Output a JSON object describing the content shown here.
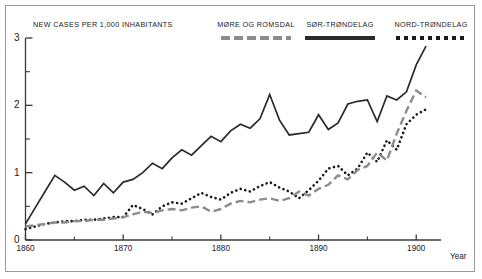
{
  "figure": {
    "y_axis_title": "NEW CASES PER 1,000 INHABITANTS",
    "x_axis_title": "Year"
  },
  "legend": {
    "items": [
      {
        "label": "MØRE OG ROMSDAL",
        "style": "dashed",
        "color": "#8c8c8c",
        "name": "more-og-romsdal"
      },
      {
        "label": "SØR-TRØNDELAG",
        "style": "solid",
        "color": "#2b2b2b",
        "name": "sor-trondelag"
      },
      {
        "label": "NORD-TRØNDELAG",
        "style": "dotted",
        "color": "#1a1a1a",
        "name": "nord-trondelag"
      }
    ]
  },
  "axes": {
    "y_major_labels": [
      "3",
      "2",
      "1",
      "0"
    ],
    "y_major_values": [
      3,
      2,
      1,
      0
    ],
    "y_minor_values": [
      2.5,
      1.5,
      0.5
    ],
    "x_major_labels": [
      "1860",
      "1870",
      "1880",
      "1890",
      "1900"
    ],
    "x_major_values": [
      1860,
      1870,
      1880,
      1890,
      1900
    ],
    "x_minor_values": [
      1865,
      1875,
      1885,
      1895
    ]
  },
  "chart_data": {
    "type": "line",
    "title": "",
    "subtitle": "",
    "xlabel": "Year",
    "ylabel": "NEW CASES PER 1,000 INHABITANTS",
    "xlim": [
      1860,
      1901
    ],
    "ylim": [
      0,
      3
    ],
    "grid": false,
    "legend_position": "top",
    "x": [
      1860,
      1861,
      1862,
      1863,
      1864,
      1865,
      1866,
      1867,
      1868,
      1869,
      1870,
      1871,
      1872,
      1873,
      1874,
      1875,
      1876,
      1877,
      1878,
      1879,
      1880,
      1881,
      1882,
      1883,
      1884,
      1885,
      1886,
      1887,
      1888,
      1889,
      1890,
      1891,
      1892,
      1893,
      1894,
      1895,
      1896,
      1897,
      1898,
      1899,
      1900,
      1901
    ],
    "series": [
      {
        "name": "SØR-TRØNDELAG",
        "style": "solid",
        "color": "#2b2b2b",
        "values": [
          0.24,
          0.48,
          0.72,
          0.96,
          0.86,
          0.74,
          0.8,
          0.66,
          0.84,
          0.7,
          0.86,
          0.9,
          1.0,
          1.14,
          1.06,
          1.22,
          1.34,
          1.26,
          1.4,
          1.54,
          1.46,
          1.62,
          1.72,
          1.66,
          1.8,
          2.16,
          1.78,
          1.56,
          1.58,
          1.6,
          1.86,
          1.64,
          1.74,
          2.02,
          2.06,
          2.08,
          1.76,
          2.14,
          2.08,
          2.2,
          2.6,
          2.88
        ]
      },
      {
        "name": "NORD-TRØNDELAG",
        "style": "dotted",
        "color": "#1a1a1a",
        "values": [
          0.16,
          0.2,
          0.24,
          0.26,
          0.28,
          0.28,
          0.3,
          0.3,
          0.32,
          0.34,
          0.34,
          0.52,
          0.46,
          0.38,
          0.5,
          0.56,
          0.54,
          0.62,
          0.7,
          0.64,
          0.6,
          0.7,
          0.76,
          0.72,
          0.8,
          0.86,
          0.78,
          0.72,
          0.62,
          0.74,
          0.88,
          1.06,
          1.1,
          0.96,
          1.06,
          1.3,
          1.16,
          1.48,
          1.34,
          1.72,
          1.86,
          1.94
        ]
      },
      {
        "name": "MØRE OG ROMSDAL",
        "style": "dashed",
        "color": "#8c8c8c",
        "values": [
          0.2,
          0.22,
          0.24,
          0.26,
          0.26,
          0.28,
          0.28,
          0.3,
          0.3,
          0.32,
          0.34,
          0.38,
          0.42,
          0.4,
          0.44,
          0.46,
          0.44,
          0.48,
          0.5,
          0.42,
          0.46,
          0.54,
          0.58,
          0.56,
          0.6,
          0.62,
          0.58,
          0.62,
          0.72,
          0.66,
          0.76,
          0.82,
          0.96,
          0.9,
          1.04,
          1.1,
          1.3,
          1.18,
          1.58,
          1.92,
          2.22,
          2.12
        ]
      }
    ]
  }
}
